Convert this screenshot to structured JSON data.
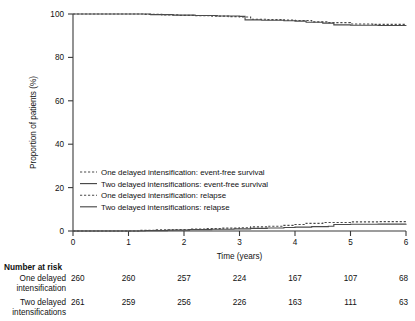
{
  "chart_data": {
    "type": "line",
    "title": "",
    "xlabel": "Time (years)",
    "ylabel": "Proportion of patients (%)",
    "xlim": [
      0,
      6
    ],
    "ylim": [
      0,
      100
    ],
    "xticks": [
      "0",
      "1",
      "2",
      "3",
      "4",
      "5",
      "6"
    ],
    "yticks": [
      "0",
      "20",
      "40",
      "60",
      "80",
      "100"
    ],
    "grid": false,
    "legend_position": "center-left",
    "series": [
      {
        "name": "One delayed intensification: event-free survival",
        "style": "dashed",
        "x": [
          0,
          1.0,
          1.3,
          1.6,
          1.9,
          2.2,
          2.5,
          2.8,
          3.0,
          3.2,
          3.5,
          3.8,
          4.0,
          4.3,
          4.6,
          5.0,
          5.4,
          6.0
        ],
        "y": [
          100,
          100,
          99.8,
          99.6,
          99.4,
          99.2,
          99.0,
          98.8,
          98.6,
          97.6,
          97.4,
          97.2,
          97.0,
          96.4,
          96.0,
          95.4,
          95.2,
          95.0
        ]
      },
      {
        "name": "Two delayed intensifications: event-free survival",
        "style": "solid",
        "x": [
          0,
          1.0,
          1.4,
          1.8,
          2.2,
          2.6,
          3.0,
          3.1,
          3.4,
          3.8,
          4.0,
          4.2,
          4.5,
          4.7,
          5.0,
          5.5,
          6.0
        ],
        "y": [
          100,
          100,
          99.7,
          99.5,
          99.3,
          99.1,
          98.9,
          97.3,
          97.1,
          96.9,
          96.7,
          96.2,
          95.8,
          95.0,
          94.8,
          94.7,
          94.6
        ]
      },
      {
        "name": "One delayed intensification: relapse",
        "style": "dashed",
        "x": [
          0,
          1.0,
          1.2,
          1.5,
          1.8,
          2.1,
          2.4,
          2.7,
          3.0,
          3.2,
          3.5,
          3.8,
          4.0,
          4.2,
          4.5,
          5.0,
          5.5,
          6.0
        ],
        "y": [
          0,
          0,
          0.3,
          0.5,
          0.7,
          0.9,
          1.1,
          1.3,
          1.5,
          1.9,
          2.2,
          2.6,
          3.0,
          3.5,
          3.9,
          4.2,
          4.3,
          4.4
        ]
      },
      {
        "name": "Two delayed intensifications: relapse",
        "style": "solid",
        "x": [
          0,
          1.0,
          1.3,
          1.7,
          2.1,
          2.5,
          2.9,
          3.2,
          3.5,
          3.8,
          4.0,
          4.3,
          4.6,
          4.7,
          5.0,
          5.5,
          6.0
        ],
        "y": [
          0,
          0,
          0.2,
          0.4,
          0.6,
          0.8,
          1.0,
          1.2,
          1.4,
          1.6,
          1.8,
          2.0,
          2.2,
          3.0,
          3.1,
          3.2,
          3.3
        ]
      }
    ]
  },
  "legend": {
    "entries": [
      {
        "label": "One delayed intensification: event-free survival",
        "style": "dashed"
      },
      {
        "label": "Two delayed intensifications: event-free survival",
        "style": "solid"
      },
      {
        "label": "One delayed intensification: relapse",
        "style": "dashed"
      },
      {
        "label": "Two delayed intensifications: relapse",
        "style": "solid"
      }
    ]
  },
  "risk_table": {
    "title": "Number at risk",
    "rows": [
      {
        "label_line1": "One delayed",
        "label_line2": "intensification",
        "values": [
          "260",
          "260",
          "257",
          "224",
          "167",
          "107",
          "68"
        ]
      },
      {
        "label_line1": "Two delayed",
        "label_line2": "intensifications",
        "values": [
          "261",
          "259",
          "256",
          "226",
          "163",
          "111",
          "63"
        ]
      }
    ]
  },
  "colors": {
    "curve": "#4a4a4a",
    "axis": "#3a3a3a",
    "text": "#111111",
    "background": "#ffffff"
  }
}
